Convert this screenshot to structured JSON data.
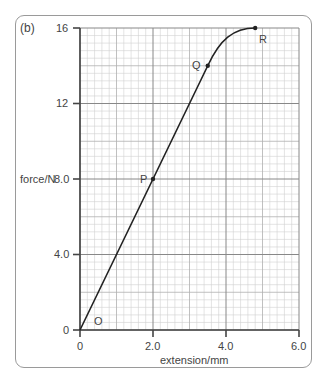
{
  "panel_label": "(b)",
  "chart_data": {
    "type": "line",
    "title": "",
    "xlabel": "extension/mm",
    "ylabel": "force/N",
    "xlim": [
      0,
      6.0
    ],
    "ylim": [
      0,
      16
    ],
    "x_ticks": [
      "0",
      "2.0",
      "4.0",
      "6.0"
    ],
    "y_ticks": [
      "0",
      "4.0",
      "8.0",
      "12",
      "16"
    ],
    "grid": true,
    "series": [
      {
        "name": "force-extension",
        "x": [
          0,
          2.0,
          3.5,
          4.8
        ],
        "y": [
          0,
          8.0,
          14,
          16
        ]
      }
    ],
    "annotations": [
      {
        "label": "O",
        "x": 0,
        "y": 0
      },
      {
        "label": "P",
        "x": 2.0,
        "y": 8.0
      },
      {
        "label": "Q",
        "x": 3.5,
        "y": 14
      },
      {
        "label": "R",
        "x": 4.8,
        "y": 16
      }
    ]
  }
}
